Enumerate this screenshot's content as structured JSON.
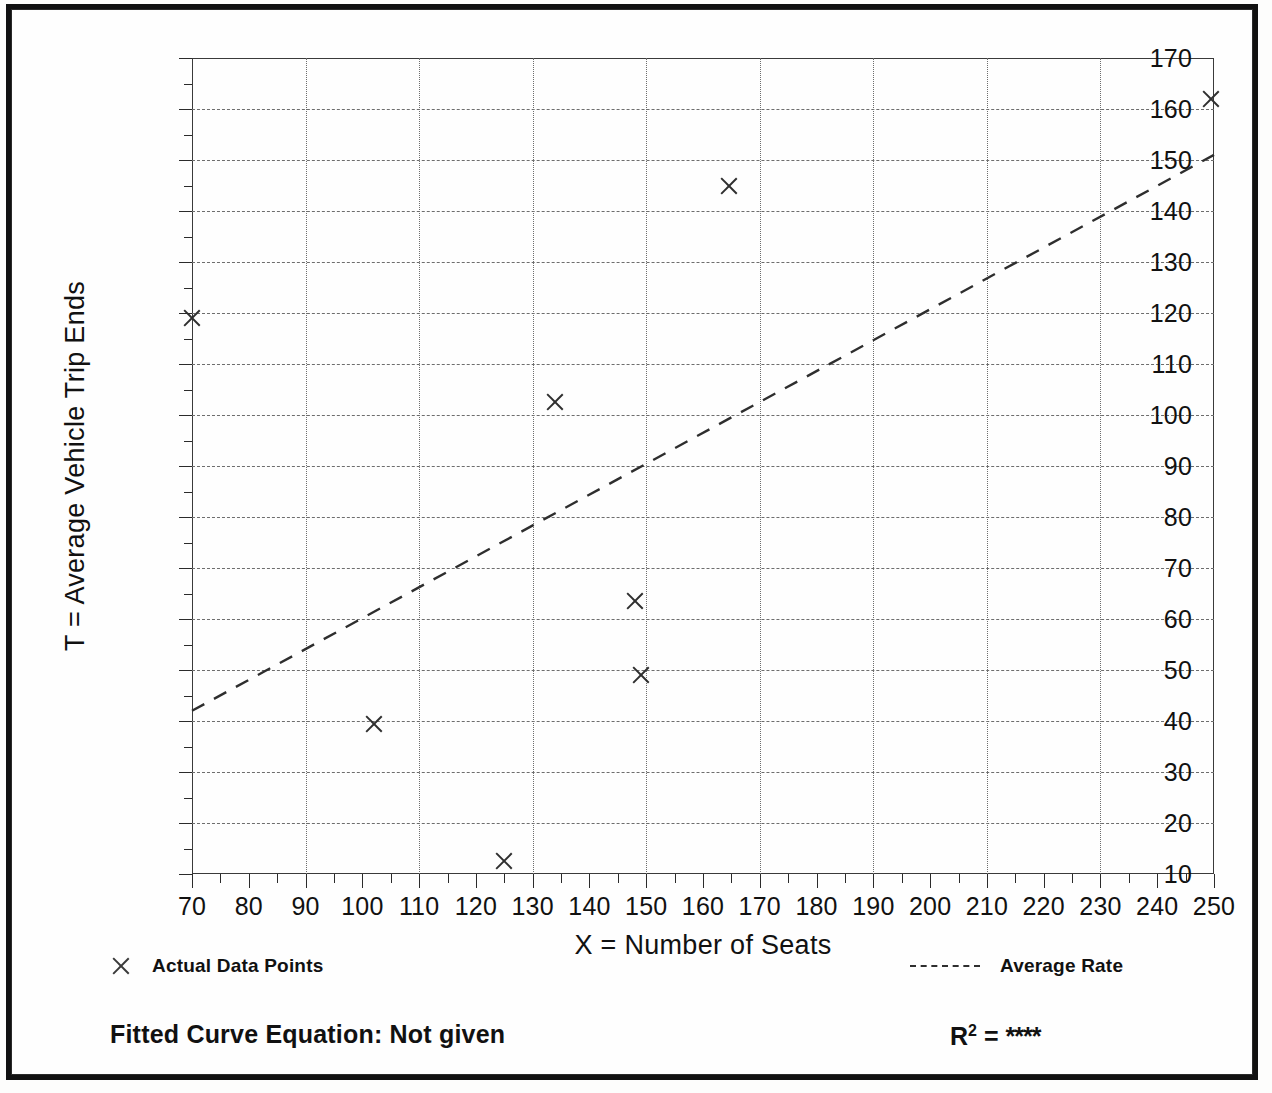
{
  "chart_data": {
    "type": "scatter",
    "title": "",
    "xlabel": "X = Number of Seats",
    "ylabel": "T = Average Vehicle Trip Ends",
    "xlim": [
      70,
      250
    ],
    "ylim": [
      10,
      170
    ],
    "x_ticks": [
      70,
      80,
      90,
      100,
      110,
      120,
      130,
      140,
      150,
      160,
      170,
      180,
      190,
      200,
      210,
      220,
      230,
      240,
      250
    ],
    "y_ticks": [
      10,
      20,
      30,
      40,
      50,
      60,
      70,
      80,
      90,
      100,
      110,
      120,
      130,
      140,
      150,
      160,
      170
    ],
    "x_gridlines": [
      90,
      110,
      130,
      150,
      170,
      190,
      210,
      230
    ],
    "y_gridlines": [
      20,
      30,
      40,
      50,
      60,
      70,
      80,
      90,
      100,
      110,
      120,
      130,
      140,
      150,
      160
    ],
    "grid": true,
    "points": [
      {
        "x": 70,
        "y": 119
      },
      {
        "x": 102,
        "y": 39.5
      },
      {
        "x": 125,
        "y": 12.5
      },
      {
        "x": 134,
        "y": 102.5
      },
      {
        "x": 148,
        "y": 63.5
      },
      {
        "x": 149,
        "y": 49
      },
      {
        "x": 164.5,
        "y": 145
      },
      {
        "x": 249.5,
        "y": 162
      }
    ],
    "trend_line": {
      "x1": 70,
      "y1": 42,
      "x2": 250,
      "y2": 151,
      "style": "dashed"
    },
    "legend": [
      {
        "key": "points",
        "marker": "x-marker",
        "label": "Actual Data Points"
      },
      {
        "key": "line",
        "marker": "dashed-line",
        "label": "Average Rate"
      }
    ],
    "legend_position": "below-axis"
  },
  "footer": {
    "equation_label": "Fitted Curve Equation:  Not given",
    "r2_prefix": "R",
    "r2_exponent": "2",
    "r2_equals": " = ",
    "r2_value": "****"
  }
}
